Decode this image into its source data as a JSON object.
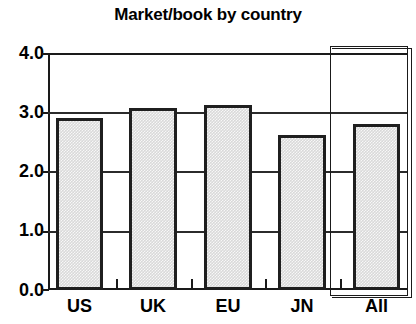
{
  "chart_data": {
    "type": "bar",
    "title": "Market/book by country",
    "xlabel": "",
    "ylabel": "",
    "categories": [
      "US",
      "UK",
      "EU",
      "JN",
      "All"
    ],
    "values": [
      2.9,
      3.08,
      3.13,
      2.62,
      2.8
    ],
    "ylim": [
      0.0,
      4.0
    ],
    "yticks": [
      "0.0",
      "1.0",
      "2.0",
      "3.0",
      "4.0"
    ],
    "ytick_values": [
      0.0,
      1.0,
      2.0,
      3.0,
      4.0
    ],
    "grid": true,
    "legend": "none",
    "annotations": [
      "All column enclosed in separate outlined box"
    ],
    "colors": {
      "bar_fill": "#d9d9d9",
      "bar_edge": "#1f1f1f",
      "axis": "#1a1a1a",
      "text": "#000000",
      "background": "#ffffff"
    }
  }
}
